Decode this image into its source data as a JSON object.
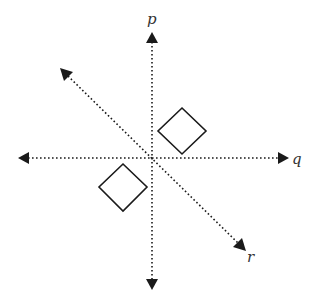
{
  "diagram": {
    "type": "reflection-lines",
    "lines": [
      {
        "id": "p",
        "label": "p",
        "orientation": "vertical",
        "style": "dotted",
        "arrows": "both"
      },
      {
        "id": "q",
        "label": "q",
        "orientation": "horizontal",
        "style": "dotted",
        "arrows": "both"
      },
      {
        "id": "r",
        "label": "r",
        "orientation": "diagonal (upper-left to lower-right)",
        "style": "dotted",
        "arrows": "both"
      }
    ],
    "shapes": [
      {
        "id": "square-upper-right",
        "kind": "square rotated 45°",
        "position": "above q, right of p"
      },
      {
        "id": "square-lower-left",
        "kind": "square rotated 45°",
        "position": "below q, left of p"
      }
    ],
    "colors": {
      "stroke": "#1a1a1a",
      "label": "#333333",
      "background": "#ffffff"
    }
  }
}
